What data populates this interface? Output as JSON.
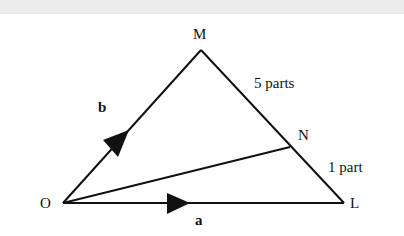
{
  "diagram": {
    "points": {
      "O": {
        "label": "O"
      },
      "M": {
        "label": "M"
      },
      "N": {
        "label": "N"
      },
      "L": {
        "label": "L"
      }
    },
    "vectors": {
      "a": {
        "label": "a",
        "from": "O",
        "to": "L"
      },
      "b": {
        "label": "b",
        "from": "O",
        "to": "M"
      }
    },
    "segments": {
      "MN": {
        "label": "5 parts"
      },
      "NL": {
        "label": "1 part"
      }
    },
    "colors": {
      "line": "#111111",
      "background": "#ffffff",
      "top_band": "#ececec"
    }
  }
}
